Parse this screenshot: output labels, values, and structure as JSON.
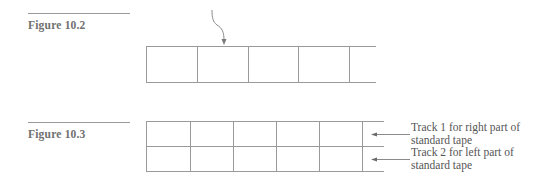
{
  "figures": [
    {
      "caption": "Figure 10.2",
      "diagram": "single-track tape with head arrow",
      "cells_visible": 5
    },
    {
      "caption": "Figure 10.3",
      "diagram": "two-track tape",
      "cells_visible": 5,
      "track_labels": [
        {
          "line1": "Track 1 for right part of",
          "line2": "standard tape"
        },
        {
          "line1": "Track 2 for left part of",
          "line2": "standard tape"
        }
      ]
    }
  ],
  "colors": {
    "line": "#9a9a9a",
    "text": "#6a6a6a"
  }
}
